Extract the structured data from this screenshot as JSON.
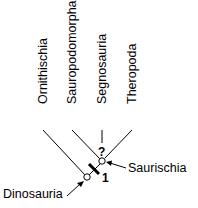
{
  "diagram": {
    "type": "cladogram",
    "taxa": [
      {
        "label": "Ornithischia",
        "x": 47,
        "line_start": [
          43,
          130
        ]
      },
      {
        "label": "Sauropodomorpha",
        "x": 76,
        "line_start": [
          72,
          130
        ]
      },
      {
        "label": "Segnosauria",
        "x": 106,
        "line_start": [
          102,
          130
        ]
      },
      {
        "label": "Theropoda",
        "x": 136,
        "line_start": [
          132,
          130
        ]
      }
    ],
    "nodes": [
      {
        "name": "Dinosauria",
        "label": "Dinosauria"
      },
      {
        "name": "Saurischia",
        "label": "Saurischia"
      }
    ],
    "uncertainty_mark": "?",
    "character_marker": "1",
    "colors": {
      "line": "#000000",
      "background": "#ffffff"
    }
  }
}
